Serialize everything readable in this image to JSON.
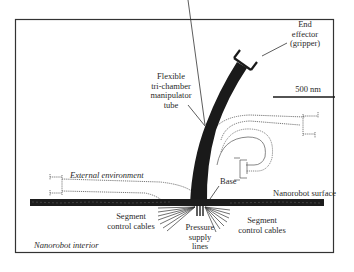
{
  "diagram": {
    "type": "schematic",
    "labels": {
      "end_effector": [
        "End",
        "effector",
        "(gripper)"
      ],
      "manipulator": [
        "Flexible",
        "tri-chamber",
        "manipulator",
        "tube"
      ],
      "scale_bar": "500 nm",
      "external": "External environment",
      "base": "Base",
      "surface": "Nanorobot surface",
      "cables_left": [
        "Segment",
        "control cables"
      ],
      "cables_right": [
        "Segment",
        "control cables"
      ],
      "pressure": [
        "Pressure",
        "supply",
        "lines"
      ],
      "interior": "Nanorobot interior"
    },
    "colors": {
      "ink": "#1a1a1a",
      "text": "#2a2a2a",
      "dotted": "#555555",
      "background": "#ffffff"
    }
  }
}
